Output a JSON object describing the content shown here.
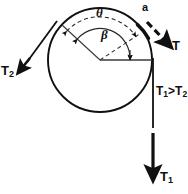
{
  "figure": {
    "labels": {
      "tension_out": "T",
      "tension_small": "T₂",
      "tension_large": "T₁",
      "tension_small_base": "T",
      "tension_small_sub": "2",
      "tension_large_base": "T",
      "tension_large_sub": "1",
      "angle_theta": "θ",
      "angle_beta": "β",
      "point_a": "a",
      "relation_base_1": "T",
      "relation_sub_1": "1",
      "relation_operator": ">",
      "relation_base_2": "T",
      "relation_sub_2": "2",
      "relation_full": "T₁>T₂"
    },
    "colors": {
      "stroke": "#101010",
      "background": "#ffffff",
      "dashed_guide": "#2a2a2a"
    }
  },
  "geometry": {
    "circle": {
      "cx": 100,
      "cy": 60,
      "r": 52
    },
    "center_point": {
      "x": 100,
      "y": 60
    },
    "tangent_point_a": {
      "x": 144,
      "y": 32
    },
    "tangent_point_t2": {
      "x": 57,
      "y": 21
    },
    "tangent_point_t1": {
      "x": 152,
      "y": 60
    },
    "theta_arc_radius": 44,
    "beta_arc_radius": 30,
    "theta_span_label": "θ",
    "beta_span_label": "β"
  }
}
